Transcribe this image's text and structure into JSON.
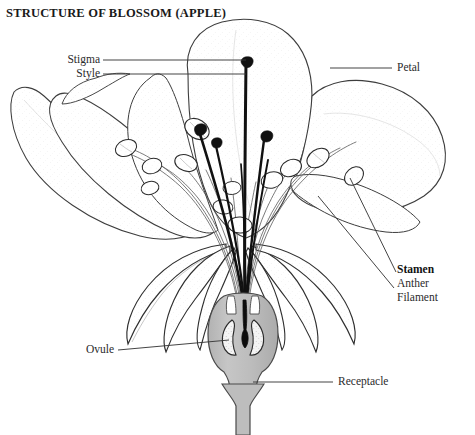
{
  "title": "STRUCTURE OF BLOSSOM (APPLE)",
  "labels": {
    "stigma": "Stigma",
    "style": "Style",
    "petal": "Petal",
    "stamen": "Stamen",
    "anther": "Anther",
    "filament": "Filament",
    "ovule": "Ovule",
    "receptacle": "Receptacle"
  },
  "colors": {
    "background": "#ffffff",
    "ink": "#1a1a1a",
    "outline": "#3a3a3a",
    "hairline": "#6d6d6d",
    "leader": "#4a4a4a",
    "ovary_fill": "#bdbdbd",
    "ovary_fill_dark": "#a8a8a8",
    "ovule_fill": "#f2f2f2",
    "locule_fill": "#0d0d0d",
    "petal_fill": "#fdfdfd",
    "anther_fill": "#fbfbfb",
    "text": "#2b2b2b"
  },
  "figure": {
    "caption_note": "Longitudinal section of an apple blossom showing pistil, stamens, petals, sepals, ovary with ovules, and receptacle."
  }
}
